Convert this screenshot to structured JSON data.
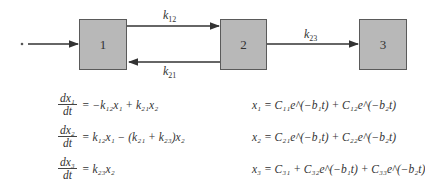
{
  "diagram": {
    "input_marker": "*",
    "compartments": [
      {
        "id": "1",
        "label": "1"
      },
      {
        "id": "2",
        "label": "2"
      },
      {
        "id": "3",
        "label": "3"
      }
    ],
    "rate_constants": [
      {
        "from": "1",
        "to": "2",
        "label": "k",
        "sub": "12"
      },
      {
        "from": "2",
        "to": "1",
        "label": "k",
        "sub": "21"
      },
      {
        "from": "2",
        "to": "3",
        "label": "k",
        "sub": "23"
      }
    ],
    "colors": {
      "box_fill": "#b8b8b8",
      "box_border": "#5a5a5a",
      "line": "#333333"
    }
  },
  "equations": {
    "differential": [
      {
        "num": "dx₁",
        "den": "dt",
        "rhs": "= −k₁₂x₁ + k₂₁x₂"
      },
      {
        "num": "dx₂",
        "den": "dt",
        "rhs": "= k₁₂x₁ − (k₂₁ + k₂₃)x₂"
      },
      {
        "num": "dx₃",
        "den": "dt",
        "rhs": "= k₂₃x₂"
      }
    ],
    "solutions": [
      "x₁ = C₁₁e^(−b₁t) + C₁₂e^(−b₂t)",
      "x₂ = C₂₁e^(−b₁t) + C₂₂e^(−b₂t)",
      "x₃ = C₃₁ + C₃₂e^(−b₁t) + C₃₃e^(−b₂t)"
    ]
  }
}
